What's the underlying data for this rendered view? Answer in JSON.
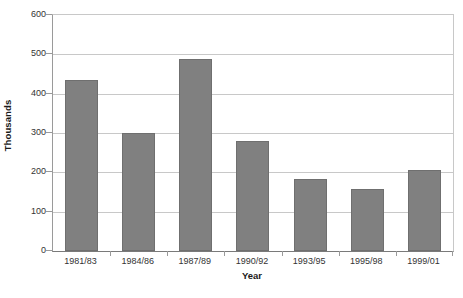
{
  "chart_data": {
    "type": "bar",
    "title": "",
    "subtitle": "",
    "xlabel": "Year",
    "ylabel": "Thousands",
    "categories": [
      "1981/83",
      "1984/86",
      "1987/89",
      "1990/92",
      "1993/95",
      "1995/98",
      "1999/01"
    ],
    "values": [
      435,
      301,
      487,
      280,
      184,
      157,
      206
    ],
    "ylim": [
      0,
      600
    ],
    "yticks": [
      0,
      100,
      200,
      300,
      400,
      500,
      600
    ],
    "ytick_labels": [
      "0",
      "100",
      "200",
      "300",
      "400",
      "500",
      "600"
    ],
    "grid": true,
    "grid_axis": "y",
    "legend": false,
    "legend_position": "none",
    "series": [
      {
        "name": "",
        "color": "#808080",
        "values": [
          435,
          301,
          487,
          280,
          184,
          157,
          206
        ]
      }
    ]
  },
  "colors": {
    "bar_fill": "#808080",
    "bar_border": "#6f6f6f",
    "gridline": "#c8c8c8",
    "axis": "#9a9a9a",
    "text": "#333333",
    "title_text": "#1a1a1a",
    "background": "#ffffff"
  }
}
